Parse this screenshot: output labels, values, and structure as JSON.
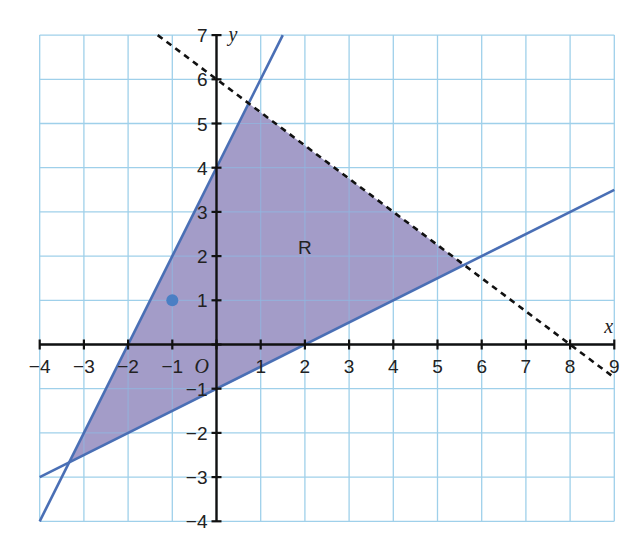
{
  "chart_data": {
    "type": "line",
    "title": "",
    "xlabel": "x",
    "ylabel": "y",
    "origin_label": "O",
    "xlim": [
      -4,
      9
    ],
    "ylim": [
      -4,
      7
    ],
    "grid": true,
    "x_ticks": [
      -4,
      -3,
      -2,
      -1,
      1,
      2,
      3,
      4,
      5,
      6,
      7,
      8,
      9
    ],
    "y_ticks": [
      -4,
      -3,
      -2,
      -1,
      1,
      2,
      3,
      4,
      5,
      6,
      7
    ],
    "series": [
      {
        "name": "y = 2x + 4",
        "style": "solid",
        "points": [
          [
            -4,
            -4
          ],
          [
            1.5,
            7
          ]
        ]
      },
      {
        "name": "y = x/2 - 1",
        "style": "solid",
        "points": [
          [
            -4,
            -3
          ],
          [
            9,
            3.5
          ]
        ]
      },
      {
        "name": "3x + 4y = 24",
        "style": "dashed",
        "points": [
          [
            -1.33,
            7
          ],
          [
            9,
            -0.75
          ]
        ]
      }
    ],
    "region": {
      "label": "R",
      "label_position": [
        2.0,
        2.2
      ],
      "vertices": [
        [
          -3.33,
          -2.67
        ],
        [
          0.73,
          5.45
        ],
        [
          5.6,
          1.8
        ]
      ]
    },
    "points": [
      {
        "x": -1,
        "y": 1,
        "color": "#4a7fc4"
      }
    ],
    "colors": {
      "grid": "#9fd0ea",
      "region_fill": "#a39cc8",
      "boundary_line": "#4a6fb5",
      "axis": "#111111",
      "dashed_line": "#111111"
    }
  }
}
